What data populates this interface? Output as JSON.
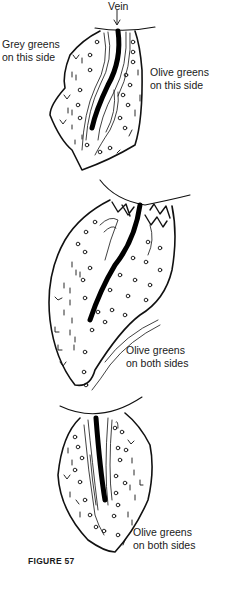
{
  "figure": {
    "caption": "FIGURE 57",
    "leaves": [
      {
        "id": "leaf-1",
        "labels": [
          {
            "position": "top",
            "lines": [
              "Vein"
            ]
          },
          {
            "position": "left",
            "lines": [
              "Grey greens",
              "on this side"
            ]
          },
          {
            "position": "right",
            "lines": [
              "Olive greens",
              "on this side"
            ]
          }
        ]
      },
      {
        "id": "leaf-2",
        "labels": [
          {
            "position": "bottom-right",
            "lines": [
              "Olive greens",
              "on both sides"
            ]
          }
        ]
      },
      {
        "id": "leaf-3",
        "labels": [
          {
            "position": "bottom-right",
            "lines": [
              "Olive greens",
              "on both sides"
            ]
          }
        ]
      }
    ]
  }
}
